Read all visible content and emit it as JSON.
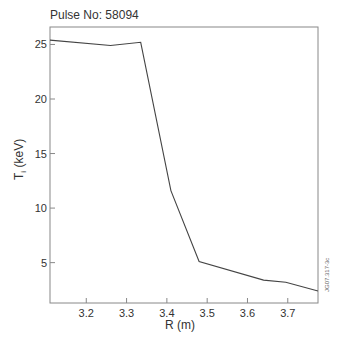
{
  "chart_data": {
    "type": "line",
    "title": "Pulse No: 58094",
    "xlabel": "R (m)",
    "ylabel": "Ti (keV)",
    "ylabel_main": "T",
    "ylabel_sub": "i",
    "ylabel_unit": " (keV)",
    "watermark": "JG07.317-3c",
    "xlim": [
      3.11,
      3.775
    ],
    "ylim": [
      1.3,
      26.6
    ],
    "xticks": [
      3.2,
      3.3,
      3.4,
      3.5,
      3.6,
      3.7
    ],
    "xtick_labels": [
      "3.2",
      "3.3",
      "3.4",
      "3.5",
      "3.6",
      "3.7"
    ],
    "yticks": [
      5,
      10,
      15,
      20,
      25
    ],
    "ytick_labels": [
      "5",
      "10",
      "15",
      "20",
      "25"
    ],
    "grid": false,
    "series": [
      {
        "name": "Ti",
        "color": "#444444",
        "x": [
          3.11,
          3.26,
          3.335,
          3.41,
          3.48,
          3.64,
          3.695,
          3.775
        ],
        "y": [
          25.4,
          24.9,
          25.2,
          11.6,
          5.1,
          3.4,
          3.2,
          2.4
        ]
      }
    ]
  }
}
